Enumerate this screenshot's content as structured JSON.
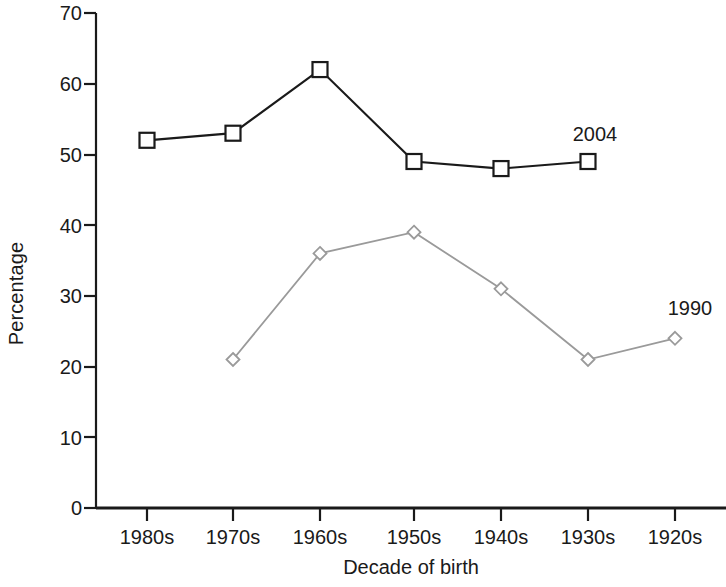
{
  "chart_data": {
    "type": "line",
    "title": "",
    "xlabel": "Decade of birth",
    "ylabel": "Percentage",
    "categories": [
      "1980s",
      "1970s",
      "1960s",
      "1950s",
      "1940s",
      "1930s",
      "1920s"
    ],
    "ylim": [
      0,
      70
    ],
    "yticks": [
      0,
      10,
      20,
      30,
      40,
      50,
      60,
      70
    ],
    "ytick_labels": [
      "0",
      "10",
      "20",
      "30",
      "40",
      "50",
      "60",
      "70"
    ],
    "grid": false,
    "legend_position": "inline-end-of-line",
    "series": [
      {
        "name": "2004",
        "label": "2004",
        "marker": "square",
        "color": "#1a1a1a",
        "x": [
          "1980s",
          "1970s",
          "1960s",
          "1950s",
          "1940s",
          "1930s"
        ],
        "values": [
          52,
          53,
          62,
          49,
          48,
          49
        ]
      },
      {
        "name": "1990",
        "label": "1990",
        "marker": "diamond",
        "color": "#9a9a9a",
        "x": [
          "1970s",
          "1960s",
          "1950s",
          "1940s",
          "1930s",
          "1920s"
        ],
        "values": [
          21,
          36,
          39,
          31,
          21,
          24
        ]
      }
    ],
    "annotations": [
      {
        "text": "2004",
        "x": "1930s",
        "y": 56
      },
      {
        "text": "1990",
        "x": "1920s",
        "y": 31
      }
    ]
  },
  "axes": {
    "y_title": "Percentage",
    "x_title": "Decade of birth"
  }
}
